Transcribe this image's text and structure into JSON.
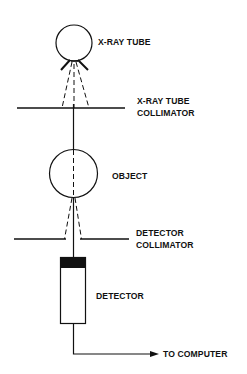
{
  "diagram": {
    "type": "x-ray transmission measurement schematic",
    "colors": {
      "line": "#111111",
      "background": "#ffffff",
      "detector_cap": "#111111"
    },
    "labels": {
      "xray_tube": "X-RAY TUBE",
      "xray_tube_collimator_line1": "X-RAY TUBE",
      "xray_tube_collimator_line2": "COLLIMATOR",
      "object": "OBJECT",
      "detector_collimator_line1": "DETECTOR",
      "detector_collimator_line2": "COLLIMATOR",
      "detector": "DETECTOR",
      "to_computer": "TO COMPUTER"
    },
    "components": [
      {
        "name": "X-ray tube",
        "shape": "circle"
      },
      {
        "name": "X-ray tube collimator",
        "shape": "horizontal line"
      },
      {
        "name": "Object",
        "shape": "circle"
      },
      {
        "name": "Detector collimator",
        "shape": "horizontal line with aperture"
      },
      {
        "name": "Detector",
        "shape": "rectangle with black cap"
      },
      {
        "name": "Output to computer",
        "shape": "arrow"
      }
    ]
  }
}
